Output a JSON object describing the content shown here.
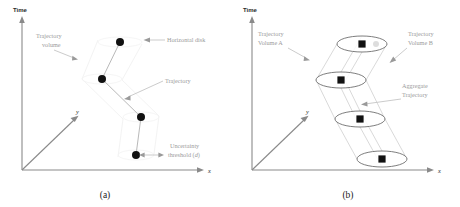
{
  "figure": {
    "background_color": "#ffffff",
    "dot_color": "#111111",
    "line_color": "#b9b9b9",
    "axis_color": "#8a8a8a",
    "label_color": "#9b9b9b",
    "ellipse_stroke": "#6f6f6f"
  },
  "panel_a": {
    "caption": "(a)",
    "axes": {
      "vertical_label": "Time",
      "horizontal_label": "x",
      "depth_label": "y"
    },
    "labels": {
      "trajectory_volume_line1": "Trajectory",
      "trajectory_volume_line2": "volume",
      "horizontal_disk": "Horizontal disk",
      "trajectory": "Trajectory",
      "uncertainty_line1": "Uncertainty",
      "uncertainty_line2": "threshold (",
      "uncertainty_symbol": "d",
      "uncertainty_line2_close": ")"
    },
    "nodes": [
      {
        "id": "n1",
        "x": 120,
        "y": 42
      },
      {
        "id": "n2",
        "x": 102,
        "y": 79
      },
      {
        "id": "n3",
        "x": 141,
        "y": 117
      },
      {
        "id": "n4",
        "x": 136,
        "y": 155
      }
    ]
  },
  "panel_b": {
    "caption": "(b)",
    "axes": {
      "vertical_label": "Time",
      "horizontal_label": "x",
      "depth_label": "y"
    },
    "labels": {
      "volume_a_line1": "Trajectory",
      "volume_a_line2": "Volume A",
      "volume_b_line1": "Trajectory",
      "volume_b_line2": "Volume B",
      "aggregate_line1": "Aggregate",
      "aggregate_line2": "Trajectory"
    },
    "disks": [
      {
        "id": "d1",
        "cx": 132,
        "cy": 44,
        "rx": 25,
        "ry": 8
      },
      {
        "id": "d2",
        "cx": 111,
        "cy": 80,
        "rx": 25,
        "ry": 8
      },
      {
        "id": "d3",
        "cx": 130,
        "cy": 119,
        "rx": 25,
        "ry": 8
      },
      {
        "id": "d4",
        "cx": 152,
        "cy": 159,
        "rx": 25,
        "ry": 8
      }
    ]
  }
}
